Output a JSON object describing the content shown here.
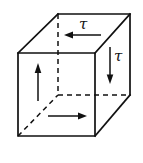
{
  "figure": {
    "name": "shear-stress-cube",
    "background_color": "#ffffff",
    "stroke_color": "#111111",
    "stroke_width": 1.6,
    "dashed_stroke_width": 1.5,
    "dash_pattern": "5,4"
  },
  "cube": {
    "front_face": {
      "name": "front-face",
      "top_left": [
        18,
        53
      ],
      "top_right": [
        95,
        53
      ],
      "bottom_right": [
        95,
        136
      ],
      "bottom_left": [
        18,
        136
      ]
    },
    "back_face": {
      "name": "back-face",
      "top_left": [
        58,
        14
      ],
      "top_right": [
        130,
        14
      ],
      "bottom_right": [
        130,
        95
      ],
      "bottom_left": [
        58,
        95
      ]
    },
    "visible_edges": [
      {
        "name": "front-top-edge",
        "from": [
          18,
          53
        ],
        "to": [
          95,
          53
        ]
      },
      {
        "name": "front-right-edge",
        "from": [
          95,
          53
        ],
        "to": [
          95,
          136
        ]
      },
      {
        "name": "front-bottom-edge",
        "from": [
          95,
          136
        ],
        "to": [
          18,
          136
        ]
      },
      {
        "name": "front-left-edge",
        "from": [
          18,
          136
        ],
        "to": [
          18,
          53
        ]
      },
      {
        "name": "back-top-edge",
        "from": [
          58,
          14
        ],
        "to": [
          130,
          14
        ]
      },
      {
        "name": "back-right-edge",
        "from": [
          130,
          14
        ],
        "to": [
          130,
          95
        ]
      },
      {
        "name": "top-left-connector",
        "from": [
          18,
          53
        ],
        "to": [
          58,
          14
        ]
      },
      {
        "name": "top-right-connector",
        "from": [
          95,
          53
        ],
        "to": [
          130,
          14
        ]
      },
      {
        "name": "bottom-right-connector",
        "from": [
          95,
          136
        ],
        "to": [
          130,
          95
        ]
      }
    ],
    "hidden_edges": [
      {
        "name": "hidden-vertical-edge",
        "from": [
          58,
          14
        ],
        "to": [
          58,
          95
        ]
      },
      {
        "name": "hidden-back-bottom-edge",
        "from": [
          58,
          95
        ],
        "to": [
          130,
          95
        ]
      },
      {
        "name": "hidden-bottom-left-connector",
        "from": [
          18,
          136
        ],
        "to": [
          58,
          95
        ]
      }
    ]
  },
  "arrows": [
    {
      "name": "shear-arrow-top",
      "face": "top",
      "direction": "left",
      "from": [
        101,
        35
      ],
      "to": [
        65,
        35
      ],
      "label": "τ"
    },
    {
      "name": "shear-arrow-right",
      "face": "right",
      "direction": "down",
      "from": [
        110,
        47
      ],
      "to": [
        110,
        83
      ],
      "label": "τ"
    },
    {
      "name": "shear-arrow-front-left",
      "face": "front",
      "direction": "up",
      "from": [
        38,
        101
      ],
      "to": [
        38,
        64
      ],
      "label": ""
    },
    {
      "name": "shear-arrow-front-bottom",
      "face": "front",
      "direction": "right",
      "from": [
        48,
        116
      ],
      "to": [
        86,
        116
      ],
      "label": ""
    }
  ],
  "labels": {
    "tau_top": "τ",
    "tau_right": "τ"
  }
}
